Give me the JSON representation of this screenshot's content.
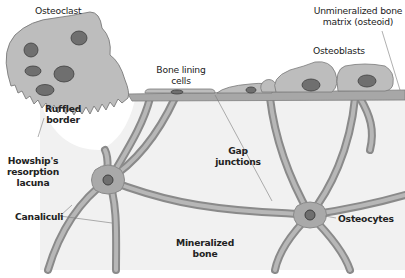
{
  "diagram": {
    "colors": {
      "background": "#ffffff",
      "mineralized_bone": "#f1f1f1",
      "bone_surface_band": "#a7a7a7",
      "cell_fill": "#b9b9b9",
      "cell_stroke": "#7a7a7a",
      "nucleus_fill": "#6f6f6f",
      "nucleus_stroke": "#3f3f3f",
      "canaliculus_outer": "#8a8a8a",
      "canaliculus_inner": "#b3b3b3",
      "leader_line": "#7a7a7a",
      "label_text": "#222222"
    },
    "labels": {
      "osteoclast": "Osteoclast",
      "unmineralized_line1": "Unmineralized bone",
      "unmineralized_line2": "matrix (osteoid)",
      "osteoblasts": "Osteoblasts",
      "bone_lining_line1": "Bone lining",
      "bone_lining_line2": "cells",
      "ruffled_line1": "Ruffled",
      "ruffled_line2": "border",
      "howship_line1": "Howship's",
      "howship_line2": "resorption",
      "howship_line3": "lacuna",
      "gap_line1": "Gap",
      "gap_line2": "junctions",
      "canaliculi": "Canaliculi",
      "osteocytes": "Osteocytes",
      "mineralized_line1": "Mineralized",
      "mineralized_line2": "bone"
    }
  }
}
